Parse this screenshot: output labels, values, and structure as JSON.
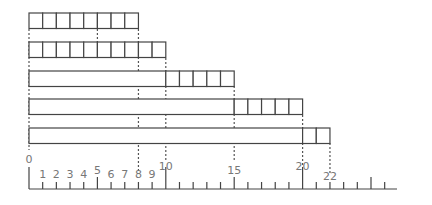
{
  "diagram": {
    "unit_px": 13.68,
    "origin_x": 29,
    "stroke_color": "#444444",
    "label_color": "#777777",
    "rows": [
      {
        "bar": 0,
        "units": 8,
        "y": 13
      },
      {
        "bar": 0,
        "units": 10,
        "y": 42
      },
      {
        "bar": 10,
        "units": 5,
        "y": 71
      },
      {
        "bar": 15,
        "units": 5,
        "y": 99
      },
      {
        "bar": 20,
        "units": 2,
        "y": 128
      }
    ],
    "dashed_guides": [
      {
        "at": 0,
        "from_y": 29,
        "to_y": 150
      },
      {
        "at": 5,
        "from_y": 29,
        "to_y": 42
      },
      {
        "at": 8,
        "from_y": 29,
        "to_y": 171
      },
      {
        "at": 10,
        "from_y": 58,
        "to_y": 161
      },
      {
        "at": 15,
        "from_y": 86,
        "to_y": 161
      },
      {
        "at": 20,
        "from_y": 115,
        "to_y": 165
      },
      {
        "at": 22,
        "from_y": 143,
        "to_y": 175
      }
    ],
    "number_line": {
      "y": 189,
      "start": 0,
      "end_x": 397,
      "max_tick": 26,
      "labels": [
        {
          "value": 0,
          "text": "0",
          "y": 163
        },
        {
          "value": 1,
          "text": "1",
          "y": 178
        },
        {
          "value": 2,
          "text": "2",
          "y": 178
        },
        {
          "value": 3,
          "text": "3",
          "y": 178
        },
        {
          "value": 4,
          "text": "4",
          "y": 178
        },
        {
          "value": 5,
          "text": "5",
          "y": 174
        },
        {
          "value": 6,
          "text": "6",
          "y": 178
        },
        {
          "value": 7,
          "text": "7",
          "y": 178
        },
        {
          "value": 8,
          "text": "8",
          "y": 178
        },
        {
          "value": 9,
          "text": "9",
          "y": 178
        },
        {
          "value": 10,
          "text": "10",
          "y": 170
        },
        {
          "value": 15,
          "text": "15",
          "y": 174
        },
        {
          "value": 20,
          "text": "20",
          "y": 170
        },
        {
          "value": 22,
          "text": "22",
          "y": 180
        }
      ]
    }
  }
}
